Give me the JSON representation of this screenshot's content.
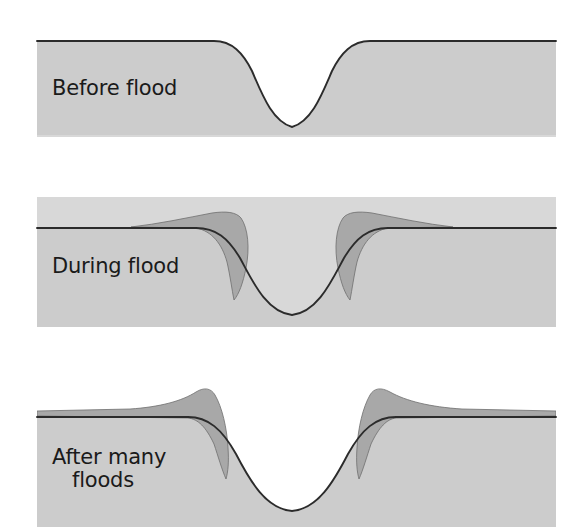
{
  "figure": {
    "background_color": "#ffffff",
    "width": 579,
    "height": 532
  },
  "colors": {
    "ground_fill": "#cccccc",
    "water_fill": "#d8d8d8",
    "sediment_fill": "#a8a8a8",
    "outline": "#2b2b2b",
    "label_text": "#1a1a1a",
    "panel_background": "#ffffff"
  },
  "panels": [
    {
      "id": "before-flood",
      "label": "Before flood",
      "label_lines": [
        "Before flood"
      ],
      "order": 1,
      "submerged": false,
      "has_sediment": false,
      "description": "Flat floodplain with an incised river channel; water sits low in the channel.",
      "bounds": {
        "x": 37,
        "y": 40,
        "width": 519,
        "height": 95
      },
      "water_level_y": 73,
      "channel_center_x": 292,
      "channel_bottom_y": 128,
      "ground_surface_y": 42
    },
    {
      "id": "during-flood",
      "label": "During flood",
      "label_lines": [
        "During flood"
      ],
      "order": 2,
      "submerged": true,
      "has_sediment": true,
      "description": "Entire floodplain is submerged; sediment-laden water deposits coarse material in wedges just beyond the channel banks.",
      "bounds": {
        "x": 37,
        "y": 197,
        "width": 519,
        "height": 130
      },
      "water_level_y": 197,
      "channel_center_x": 292,
      "channel_bottom_y": 315,
      "ground_surface_y": 228,
      "sediment_peaks": [
        {
          "side": "left",
          "x": 212,
          "y": 213
        },
        {
          "side": "right",
          "x": 372,
          "y": 213
        }
      ]
    },
    {
      "id": "after-many-floods",
      "label": "After many floods",
      "label_lines": [
        "After many",
        "floods"
      ],
      "order": 3,
      "submerged": false,
      "has_sediment": true,
      "description": "Repeated deposits build raised natural levees flanking the channel; water is again confined to the channel.",
      "bounds": {
        "x": 37,
        "y": 410,
        "width": 519,
        "height": 115
      },
      "water_level_y": 432,
      "channel_center_x": 292,
      "channel_bottom_y": 512,
      "ground_surface_y": 418,
      "sediment_peaks": [
        {
          "side": "left",
          "x": 205,
          "y": 392
        },
        {
          "side": "right",
          "x": 385,
          "y": 392
        }
      ]
    }
  ],
  "legend_semantics": {
    "ground": "floodplain sediment / land",
    "water": "river water",
    "deposit": "new sediment deposited by flood (natural levee)"
  }
}
